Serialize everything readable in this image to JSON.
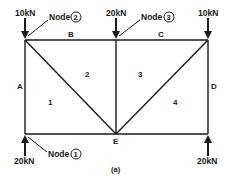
{
  "diagram": {
    "caption": "(a)",
    "loads": {
      "top_left": "10kN",
      "top_middle": "20kN",
      "top_right": "10kN",
      "bottom_left": "20kN",
      "bottom_right": "20kN"
    },
    "nodes": {
      "node1": {
        "label": "Node",
        "number": "1"
      },
      "node2": {
        "label": "Node",
        "number": "2"
      },
      "node3": {
        "label": "Node",
        "number": "3"
      }
    },
    "space_labels": {
      "A": "A",
      "B": "B",
      "C": "C",
      "D": "D",
      "E": "E"
    },
    "panel_labels": [
      "1",
      "2",
      "3",
      "4"
    ],
    "colors": {
      "ink": "#1a1a1a",
      "background": "#ffffff"
    }
  }
}
